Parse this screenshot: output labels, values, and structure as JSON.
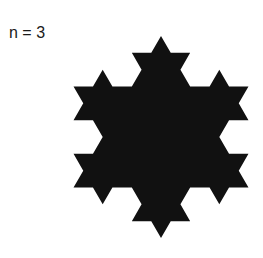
{
  "figure": {
    "label": "n = 3",
    "shape": "koch-snowflake",
    "iterations_drawn": 2,
    "fill_color": "#111111",
    "background_color": "#ffffff",
    "center": [
      161,
      137
    ],
    "circumradius": 101,
    "orientation": "point-up"
  }
}
